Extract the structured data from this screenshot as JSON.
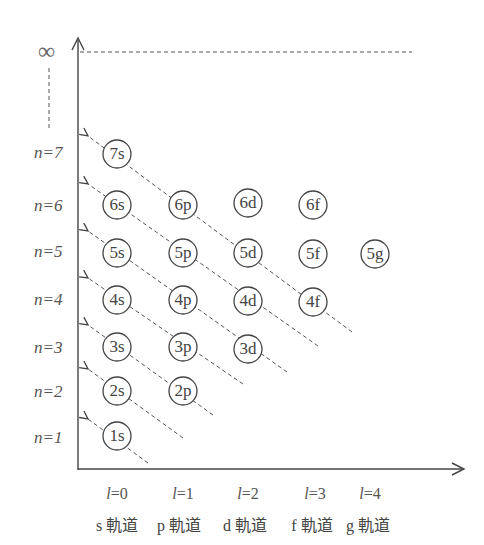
{
  "diagram": {
    "type": "aufbau-principle",
    "infinity_label": "∞",
    "y_axis": {
      "variable": "n",
      "levels": [
        {
          "n": 7,
          "label": "n=7",
          "y": 154
        },
        {
          "n": 6,
          "label": "n=6",
          "y": 205
        },
        {
          "n": 5,
          "label": "n=5",
          "y": 253
        },
        {
          "n": 4,
          "label": "n=4",
          "y": 300
        },
        {
          "n": 3,
          "label": "n=3",
          "y": 347
        },
        {
          "n": 2,
          "label": "n=2",
          "y": 391
        },
        {
          "n": 1,
          "label": "n=1",
          "y": 435
        }
      ]
    },
    "x_axis": {
      "variable": "l",
      "columns": [
        {
          "l": 0,
          "value_label": "=0",
          "orbital_label": "s 軌道",
          "x": 117
        },
        {
          "l": 1,
          "value_label": "=1",
          "orbital_label": "p 軌道",
          "x": 183
        },
        {
          "l": 2,
          "value_label": "=2",
          "orbital_label": "d 軌道",
          "x": 248
        },
        {
          "l": 3,
          "value_label": "=3",
          "orbital_label": "f 軌道",
          "x": 313
        },
        {
          "l": 4,
          "value_label": "=4",
          "orbital_label": "g 軌道",
          "x": 375
        }
      ]
    },
    "orbitals": [
      {
        "label": "7s",
        "col": 0,
        "row": 7
      },
      {
        "label": "6s",
        "col": 0,
        "row": 6
      },
      {
        "label": "6p",
        "col": 1,
        "row": 6
      },
      {
        "label": "6d",
        "col": 2,
        "row": 6
      },
      {
        "label": "6f",
        "col": 3,
        "row": 6
      },
      {
        "label": "5s",
        "col": 0,
        "row": 5
      },
      {
        "label": "5p",
        "col": 1,
        "row": 5
      },
      {
        "label": "5d",
        "col": 2,
        "row": 5
      },
      {
        "label": "5f",
        "col": 3,
        "row": 5
      },
      {
        "label": "5g",
        "col": 4,
        "row": 5
      },
      {
        "label": "4s",
        "col": 0,
        "row": 4
      },
      {
        "label": "4p",
        "col": 1,
        "row": 4
      },
      {
        "label": "4d",
        "col": 2,
        "row": 4
      },
      {
        "label": "4f",
        "col": 3,
        "row": 4
      },
      {
        "label": "3s",
        "col": 0,
        "row": 3
      },
      {
        "label": "3p",
        "col": 1,
        "row": 3
      },
      {
        "label": "3d",
        "col": 2,
        "row": 3
      },
      {
        "label": "2s",
        "col": 0,
        "row": 2
      },
      {
        "label": "2p",
        "col": 1,
        "row": 2
      },
      {
        "label": "1s",
        "col": 0,
        "row": 1
      }
    ],
    "filling_order_arrows": [
      {
        "through": [
          "1s"
        ]
      },
      {
        "through": [
          "2s"
        ]
      },
      {
        "through": [
          "3s",
          "2p"
        ]
      },
      {
        "through": [
          "4s",
          "3p"
        ]
      },
      {
        "through": [
          "5s",
          "4p",
          "3d"
        ]
      },
      {
        "through": [
          "6s",
          "5p",
          "4d"
        ]
      },
      {
        "through": [
          "7s",
          "6p",
          "5d",
          "4f"
        ]
      }
    ]
  }
}
